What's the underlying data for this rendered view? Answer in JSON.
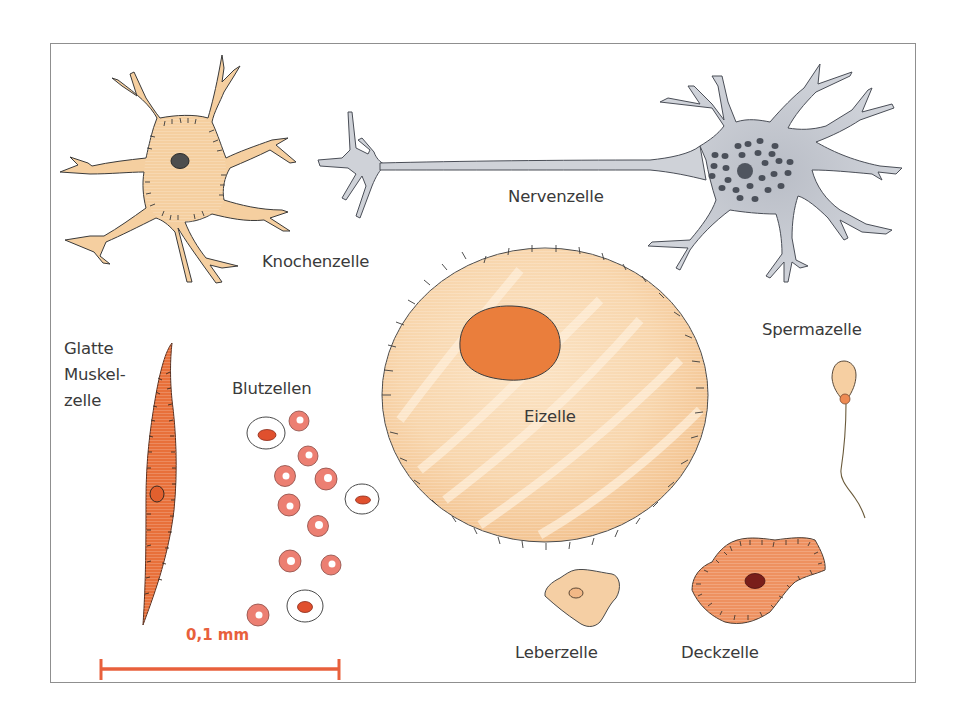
{
  "figure": {
    "type": "diagram",
    "frame_color": "#8f8f8f"
  },
  "labels": {
    "knochenzelle": "Knochenzelle",
    "nervenzelle": "Nervenzelle",
    "spermazelle": "Spermazelle",
    "glatte_muskelzelle": [
      "Glatte",
      "Muskel-",
      "zelle"
    ],
    "blutzellen": "Blutzellen",
    "eizelle": "Eizelle",
    "leberzelle": "Leberzelle",
    "deckzelle": "Deckzelle"
  },
  "scale_bar": {
    "label": "0,1 mm",
    "color": "#e8603c"
  },
  "cells": [
    {
      "id": "knochenzelle",
      "label": "Knochenzelle",
      "fill": "#f5cfa0",
      "nucleus": "#4a4a4a"
    },
    {
      "id": "nervenzelle",
      "label": "Nervenzelle",
      "fill": "#c9ccd3",
      "nucleus": "#444a55"
    },
    {
      "id": "eizelle",
      "label": "Eizelle",
      "fill": "#f7d3a8",
      "nucleus": "#ea8240"
    },
    {
      "id": "glatte-muskelzelle",
      "label": "Glatte Muskelzelle",
      "fill": "#e8703a"
    },
    {
      "id": "blutzellen",
      "label": "Blutzellen",
      "fill": "#ec8276"
    },
    {
      "id": "spermazelle",
      "label": "Spermazelle",
      "fill": "#f6cfa2"
    },
    {
      "id": "leberzelle",
      "label": "Leberzelle",
      "fill": "#f5cfa4"
    },
    {
      "id": "deckzelle",
      "label": "Deckzelle",
      "fill": "#ee9160",
      "nucleus": "#7a1e1a"
    }
  ]
}
